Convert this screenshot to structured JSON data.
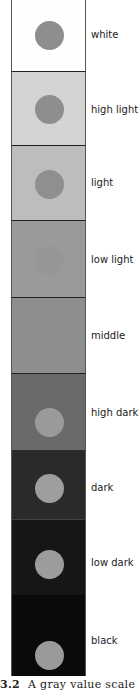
{
  "figure": {
    "caption_number": "3.2",
    "caption_text": "A gray value scale",
    "cells": [
      {
        "label": "white",
        "background": "#fefefe",
        "dot": "#8e8e8e",
        "top": 0,
        "height": 71
      },
      {
        "label": "high light",
        "background": "#d4d4d4",
        "dot": "#8e8e8e",
        "top": 72,
        "height": 73
      },
      {
        "label": "light",
        "background": "#bdbdbd",
        "dot": "#8f8f8f",
        "top": 146,
        "height": 74
      },
      {
        "label": "low light",
        "background": "#9a9a9a",
        "dot": "#969696",
        "top": 221,
        "height": 76
      },
      {
        "label": "middle",
        "background": "#8e8e8e",
        "dot": "#8e8e8e",
        "top": 298,
        "height": 75
      },
      {
        "label": "high dark",
        "background": "#6a6a6a",
        "dot": "#9a9a9a",
        "top": 374,
        "height": 76
      },
      {
        "label": "dark",
        "background": "#2a2a2a",
        "dot": "#9e9e9e",
        "top": 451,
        "height": 68
      },
      {
        "label": "low dark",
        "background": "#161616",
        "dot": "#9c9c9c",
        "top": 520,
        "height": 75
      },
      {
        "label": "black",
        "background": "#0a0a0a",
        "dot": "#9a9a9a",
        "top": 596,
        "height": 80
      }
    ]
  }
}
